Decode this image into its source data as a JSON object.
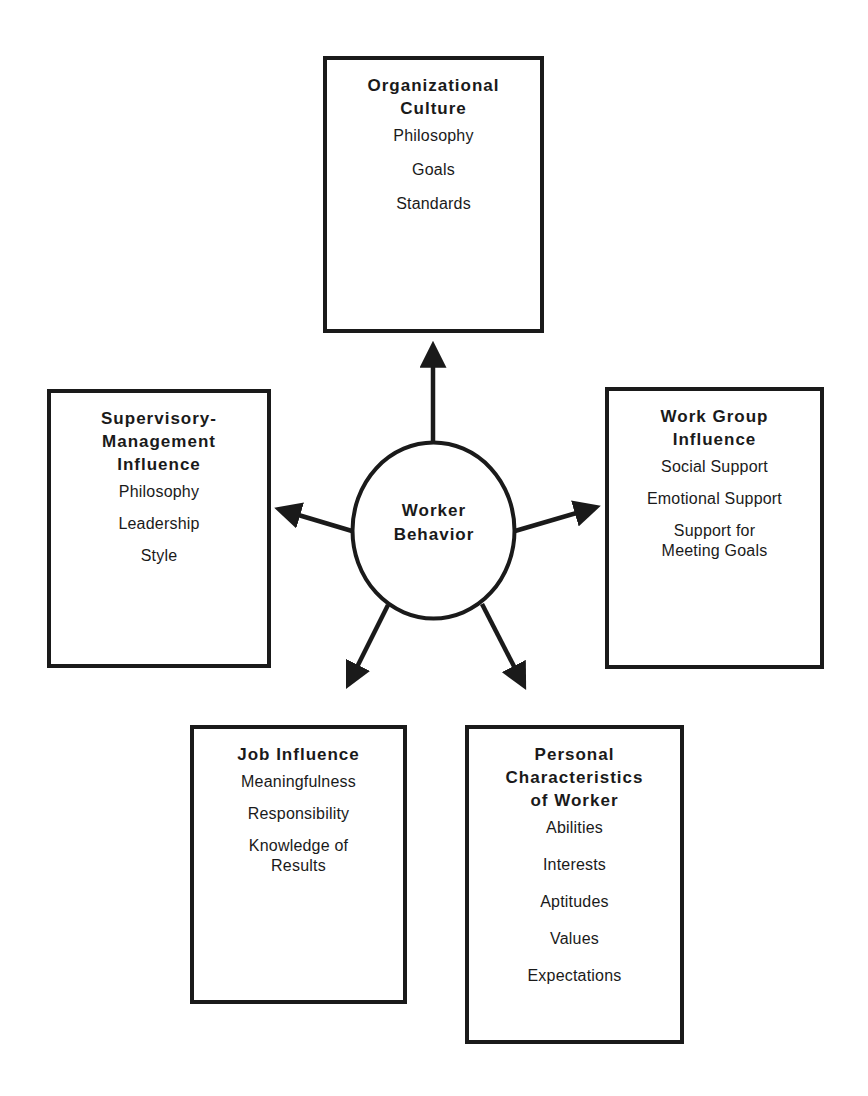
{
  "diagram": {
    "center": {
      "label": "Worker\nBehavior"
    },
    "boxes": {
      "organizational_culture": {
        "title": "Organizational\nCulture",
        "items": [
          "Philosophy",
          "Goals",
          "Standards"
        ]
      },
      "supervisory_management": {
        "title": "Supervisory-\nManagement\nInfluence",
        "items": [
          "Philosophy",
          "Leadership",
          "Style"
        ]
      },
      "work_group": {
        "title": "Work Group\nInfluence",
        "items": [
          "Social Support",
          "Emotional Support",
          "Support for\nMeeting Goals"
        ]
      },
      "job_influence": {
        "title": "Job Influence",
        "items": [
          "Meaningfulness",
          "Responsibility",
          "Knowledge of\nResults"
        ]
      },
      "personal_characteristics": {
        "title": "Personal\nCharacteristics\nof Worker",
        "items": [
          "Abilities",
          "Interests",
          "Aptitudes",
          "Values",
          "Expectations"
        ]
      }
    },
    "colors": {
      "stroke": "#1a1a1a",
      "background": "#ffffff"
    }
  }
}
